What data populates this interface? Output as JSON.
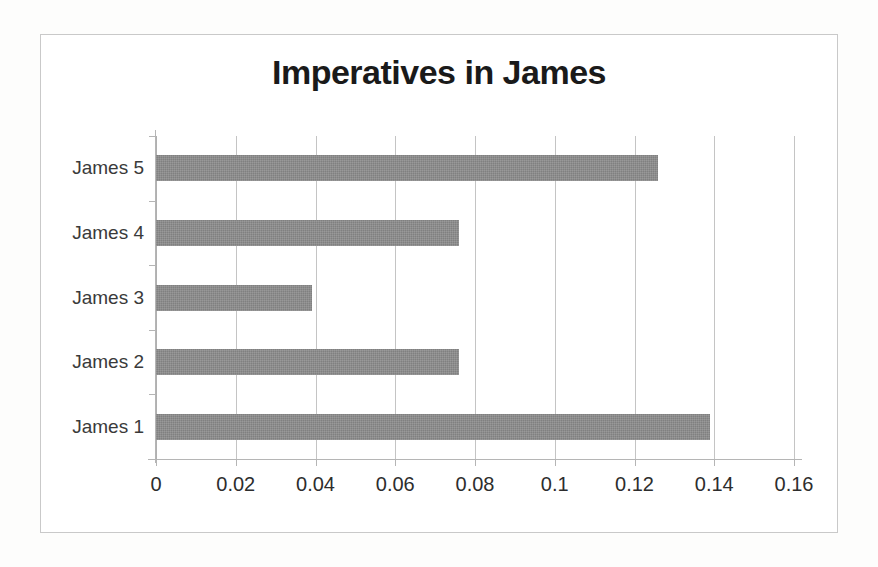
{
  "chart_data": {
    "type": "bar",
    "orientation": "horizontal",
    "title": "Imperatives in James",
    "xlabel": "",
    "ylabel": "",
    "categories": [
      "James 1",
      "James 2",
      "James 3",
      "James 4",
      "James 5"
    ],
    "values": [
      0.139,
      0.076,
      0.039,
      0.076,
      0.126
    ],
    "display_order_top_to_bottom": [
      "James 5",
      "James 4",
      "James 3",
      "James 2",
      "James 1"
    ],
    "xlim": [
      0,
      0.16
    ],
    "xticks": [
      0,
      0.02,
      0.04,
      0.06,
      0.08,
      0.1,
      0.12,
      0.14,
      0.16
    ],
    "xtick_labels": [
      "0",
      "0.02",
      "0.04",
      "0.06",
      "0.08",
      "0.1",
      "0.12",
      "0.14",
      "0.16"
    ],
    "grid": "vertical",
    "legend": "none",
    "series": [
      {
        "name": "Imperatives",
        "color": "#808080",
        "points": [
          {
            "category": "James 5",
            "value": 0.126
          },
          {
            "category": "James 4",
            "value": 0.076
          },
          {
            "category": "James 3",
            "value": 0.039
          },
          {
            "category": "James 2",
            "value": 0.076
          },
          {
            "category": "James 1",
            "value": 0.139
          }
        ]
      }
    ]
  },
  "colors": {
    "bar": "#808080",
    "gridline": "#c4c4c4",
    "axis": "#b5b5b5",
    "frame": "#c9c9c9",
    "text": "#2d2d2d",
    "title": "#1a1a1a",
    "background": "#ffffff"
  }
}
